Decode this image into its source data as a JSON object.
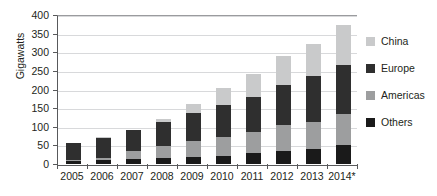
{
  "chart_data": {
    "type": "bar",
    "subtype": "stacked-bar",
    "title": "",
    "xlabel": "",
    "ylabel": "Gigawatts",
    "ylim": [
      0,
      400
    ],
    "yticks": [
      0,
      50,
      100,
      150,
      200,
      250,
      300,
      350,
      400
    ],
    "ytick_labels": [
      "0",
      "50",
      "100",
      "150",
      "200",
      "250",
      "300",
      "350",
      "400"
    ],
    "grid": true,
    "grid_axis": "y",
    "legend_position": "right",
    "categories": [
      "2005",
      "2006",
      "2007",
      "2008",
      "2009",
      "2010",
      "2011",
      "2012",
      "2013",
      "2014*"
    ],
    "stack_order_bottom_to_top": [
      "Others",
      "Americas",
      "Europe",
      "China"
    ],
    "series": [
      {
        "name": "Others",
        "color": "#1a1a1a",
        "values": [
          8,
          10,
          14,
          15,
          19,
          22,
          29,
          35,
          40,
          51
        ]
      },
      {
        "name": "Americas",
        "color": "#9d9e9f",
        "values": [
          4,
          7,
          20,
          33,
          42,
          50,
          58,
          70,
          72,
          83
        ]
      },
      {
        "name": "Europe",
        "color": "#2f2f2f",
        "values": [
          45,
          54,
          57,
          65,
          77,
          86,
          94,
          108,
          123,
          131
        ]
      },
      {
        "name": "China",
        "color": "#c9cacb",
        "values": [
          0,
          1,
          1,
          9,
          24,
          45,
          60,
          76,
          88,
          107
        ]
      }
    ],
    "totals": [
      57,
      72,
      92,
      122,
      162,
      203,
      241,
      289,
      323,
      372
    ]
  },
  "legend": {
    "items": [
      {
        "label": "China",
        "swatch_name": "legend-swatch-china",
        "color": "#c9cacb"
      },
      {
        "label": "Europe",
        "swatch_name": "legend-swatch-europe",
        "color": "#2f2f2f"
      },
      {
        "label": "Americas",
        "swatch_name": "legend-swatch-americas",
        "color": "#9d9e9f"
      },
      {
        "label": "Others",
        "swatch_name": "legend-swatch-others",
        "color": "#1a1a1a"
      }
    ]
  },
  "axis": {
    "y_title": "Gigawatts",
    "axis_color": "#58595b",
    "grid_color": "#d8d9db"
  }
}
